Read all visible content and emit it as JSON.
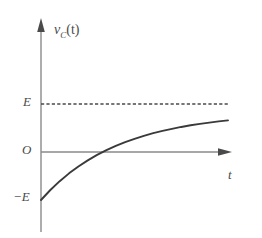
{
  "chart_data": {
    "type": "line",
    "title": "",
    "subtitle": "",
    "xlabel": "t",
    "ylabel": "v_C(t)",
    "ylabel_base": "v",
    "ylabel_sub": "C",
    "ylabel_arg": "(t)",
    "origin_label": "O",
    "grid": false,
    "legend": null,
    "axis_arrows": true,
    "xlim": [
      0,
      1
    ],
    "ylim": [
      -1,
      1.35
    ],
    "ytick_labels": [
      "E",
      "O",
      "−E"
    ],
    "ytick_values": [
      1,
      0,
      -1
    ],
    "xtick_labels": [],
    "annotations": [
      {
        "name": "asymptote",
        "style": "dashed",
        "y_value": 1,
        "label": "E",
        "description": "horizontal dashed asymptote at v_C = E"
      }
    ],
    "series": [
      {
        "name": "capacitor-voltage",
        "equation": "v_C(t) = E (1 - 2 e^{-t/RC})",
        "style": "solid",
        "color": "#3a3a3a",
        "start_value": -1,
        "asymptote": 1,
        "zero_crossing_x": 0.3,
        "x": [
          0.0,
          0.05,
          0.1,
          0.15,
          0.2,
          0.25,
          0.3,
          0.35,
          0.4,
          0.45,
          0.5,
          0.55,
          0.6,
          0.65,
          0.7,
          0.75,
          0.8,
          0.85,
          0.9,
          0.95,
          1.0
        ],
        "values": [
          -1.0,
          -0.792,
          -0.608,
          -0.445,
          -0.301,
          -0.174,
          -0.061,
          0.039,
          0.127,
          0.206,
          0.275,
          0.337,
          0.392,
          0.44,
          0.483,
          0.522,
          0.556,
          0.586,
          0.613,
          0.637,
          0.658
        ]
      }
    ],
    "colors": {
      "curve": "#3a3a3a",
      "axis": "#8a8a8a",
      "dashed": "#4a4a4a",
      "text": "#4a4a4a",
      "background": "#ffffff"
    }
  },
  "labels": {
    "y_axis_label_base": "v",
    "y_axis_label_sub": "C",
    "y_axis_label_arg": "(t)",
    "x_axis_label": "t",
    "tick_E": "E",
    "tick_O": "O",
    "tick_negE": "−E"
  }
}
